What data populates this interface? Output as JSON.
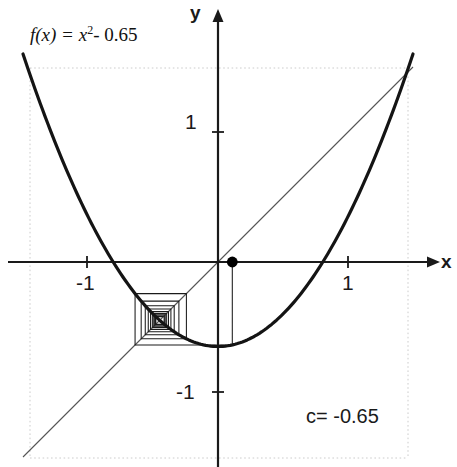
{
  "figure": {
    "function_label": {
      "prefix": "f(x) = x",
      "exponent": "2",
      "suffix": "- 0.65"
    },
    "parameter_label": "c= -0.65",
    "axis_labels": {
      "x": "x",
      "y": "y"
    },
    "tick_labels": {
      "x_negative_one": "-1",
      "x_positive_one": "1",
      "y_positive_one": "1",
      "y_negative_one": "-1"
    },
    "colors": {
      "curve": "#141414",
      "diagonal": "#555555",
      "axis": "#1a1a1a",
      "cobweb": "#1a1a1a",
      "gridline": "#cccccc",
      "background": "#ffffff",
      "point": "#000000"
    }
  },
  "chart_data": {
    "type": "line",
    "xlabel": "x",
    "ylabel": "y",
    "xlim": [
      -1.5,
      1.5
    ],
    "ylim": [
      -1.5,
      1.5
    ],
    "grid": false,
    "axis_origin_px": [
      218,
      262
    ],
    "pixels_per_unit": 130,
    "xticks": [
      -1,
      1
    ],
    "yticks": [
      -1,
      1
    ],
    "xtick_labels": [
      "-1",
      "1"
    ],
    "ytick_labels": [
      "-1",
      "1"
    ],
    "series": [
      {
        "name": "f(x) = x^2 - 0.65",
        "type": "parabola",
        "equation": "y = x^2 - 0.65",
        "c": -0.65,
        "vertex": [
          0,
          -0.65
        ],
        "roots": [
          -0.806,
          0.806
        ],
        "x_range": [
          -1.5,
          1.5
        ],
        "stroke_width": 3.2
      },
      {
        "name": "y = x",
        "type": "line",
        "equation": "y = x",
        "slope": 1,
        "intercept": 0,
        "x_range": [
          -1.5,
          1.5
        ],
        "stroke_width": 1
      },
      {
        "name": "cobweb orbit",
        "type": "cobweb",
        "x0": 0.11,
        "iterations": 18,
        "fixed_point": -0.385,
        "fixed_point_label": "attracting fixed point",
        "stroke_width": 1
      }
    ],
    "annotations": [
      {
        "text": "f(x) = x2 - 0.65",
        "x": -1.44,
        "y": 1.72
      },
      {
        "text": "c= -0.65",
        "x": 0.68,
        "y": -1.12
      },
      {
        "text": "initial point marker",
        "x": 0.11,
        "y": 0,
        "marker": "filled-circle"
      }
    ],
    "boundary_gridlines": {
      "vertical_px": [
        30,
        408
      ],
      "horizontal_px": [
        68,
        458
      ]
    }
  }
}
